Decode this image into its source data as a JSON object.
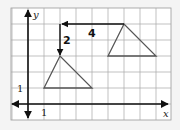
{
  "diagram": {
    "type": "coordinate-grid-translation",
    "grid": {
      "x_range": [
        -1,
        9
      ],
      "y_range": [
        -1,
        6
      ],
      "unit_px": 16,
      "origin_px": [
        28,
        104
      ],
      "line_color": "#9a9a9a",
      "background": "#ffffff"
    },
    "axes": {
      "x_label": "x",
      "y_label": "y",
      "x_tick_label": "1",
      "y_tick_label": "1",
      "color": "#111111"
    },
    "original_triangle": {
      "vertices": [
        [
          5,
          3
        ],
        [
          8,
          3
        ],
        [
          6,
          5
        ]
      ],
      "color": "#555555"
    },
    "image_triangle": {
      "vertices": [
        [
          1,
          1
        ],
        [
          4,
          1
        ],
        [
          2,
          3
        ]
      ],
      "color": "#555555"
    },
    "translation": {
      "horizontal": {
        "from": [
          6,
          5
        ],
        "to": [
          2,
          5
        ],
        "label": "4"
      },
      "vertical": {
        "from": [
          2,
          5
        ],
        "to": [
          2,
          3
        ],
        "label": "2"
      },
      "color": "#111111"
    }
  }
}
